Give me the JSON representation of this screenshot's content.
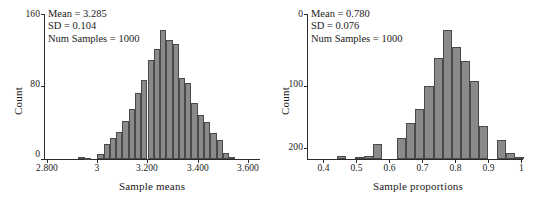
{
  "chart_data": [
    {
      "type": "bar",
      "title": "",
      "xlabel": "Sample means",
      "ylabel": "Count",
      "xlim": [
        2.8,
        3.65
      ],
      "ylim": [
        0,
        160
      ],
      "grid": false,
      "legend": "none",
      "xticks": [
        "2.800",
        "3",
        "3.200",
        "3.400",
        "3.600"
      ],
      "xtick_values": [
        2.8,
        3.0,
        3.2,
        3.4,
        3.6
      ],
      "yticks": [
        "0",
        "80",
        "160"
      ],
      "ytick_values": [
        0,
        80,
        160
      ],
      "bin_width": 0.025,
      "bin_starts": [
        2.925,
        2.95,
        3.0,
        3.025,
        3.05,
        3.075,
        3.1,
        3.125,
        3.15,
        3.175,
        3.2,
        3.225,
        3.25,
        3.275,
        3.3,
        3.325,
        3.35,
        3.375,
        3.4,
        3.425,
        3.45,
        3.475,
        3.5,
        3.525
      ],
      "values": [
        2,
        1,
        6,
        17,
        24,
        31,
        43,
        57,
        75,
        90,
        113,
        126,
        147,
        136,
        131,
        93,
        87,
        64,
        50,
        42,
        30,
        22,
        7,
        2
      ],
      "annotations": {
        "mean_label": "Mean = 3.285",
        "sd_label": "SD = 0.104",
        "num_samples_label": "Num Samples = 1000",
        "mean": 3.285,
        "sd": 0.104,
        "num_samples": 1000
      }
    },
    {
      "type": "bar",
      "title": "",
      "xlabel": "Sample proportions",
      "ylabel": "Count",
      "xlim": [
        0.37,
        1.03
      ],
      "ylim": [
        0,
        200
      ],
      "grid": false,
      "legend": "none",
      "note": "y-axis tick labels are printed inverted: 0 at top, 100 at middle, 200 at bottom",
      "xticks": [
        "0.4",
        "0.5",
        "0.6",
        "0.7",
        "0.8",
        "0.9",
        "1"
      ],
      "xtick_values": [
        0.4,
        0.5,
        0.6,
        0.7,
        0.8,
        0.9,
        1.0
      ],
      "yticks": [
        "0",
        "100",
        "200"
      ],
      "ytick_values": [
        0,
        100,
        200
      ],
      "bin_width": 0.0275,
      "bin_starts": [
        0.4425,
        0.4975,
        0.525,
        0.5525,
        0.625,
        0.6525,
        0.68,
        0.7075,
        0.735,
        0.7625,
        0.79,
        0.8175,
        0.845,
        0.8725,
        0.9275,
        0.955,
        0.9825
      ],
      "values": [
        4,
        3,
        5,
        22,
        30,
        52,
        72,
        105,
        145,
        185,
        160,
        140,
        112,
        47,
        27,
        9,
        3
      ],
      "annotations": {
        "mean_label": "Mean = 0.780",
        "sd_label": "SD = 0.076",
        "num_samples_label": "Num Samples = 1000",
        "mean": 0.78,
        "sd": 0.076,
        "num_samples": 1000
      }
    }
  ],
  "colors": {
    "bar_fill": "#8a8a8a",
    "bar_border": "#4a4a4a",
    "axis": "#2b2b2b",
    "text": "#1a1a1a",
    "background": "#ffffff"
  }
}
